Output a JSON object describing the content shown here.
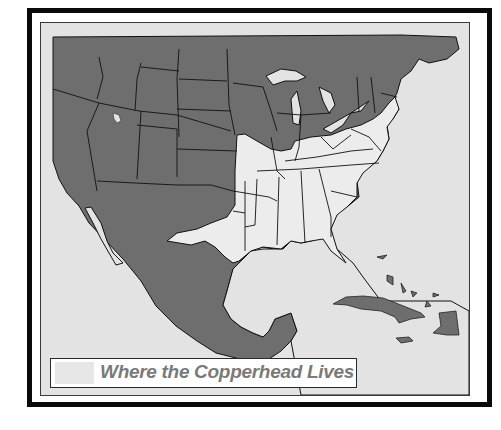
{
  "map": {
    "title": "Where the Copperhead Lives",
    "legend": {
      "label": "Where the Copperhead Lives",
      "swatch_color": "#e6e6e6"
    },
    "colors": {
      "frame": "#0a0a0a",
      "water": "#e3e3e3",
      "land_outside_range": "#6e6e6e",
      "copperhead_range": "#ececec",
      "borders": "#111111",
      "legend_text": "#7a7a7a"
    },
    "regions_shown": [
      "United States",
      "Southern Canada",
      "Mexico",
      "Cuba",
      "Bahamas",
      "Hispaniola",
      "Jamaica"
    ]
  }
}
